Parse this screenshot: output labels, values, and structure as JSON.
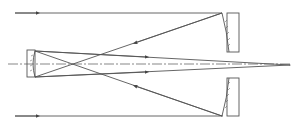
{
  "diagram": {
    "stroke_color": "#555555",
    "background": "#ffffff",
    "elements": [
      "incoming parallel ray (top)",
      "incoming parallel ray (bottom)",
      "primary mirror (upper segment)",
      "primary mirror (lower segment)",
      "secondary mirror",
      "optical axis",
      "focal point"
    ]
  },
  "caption": {
    "text": ""
  }
}
